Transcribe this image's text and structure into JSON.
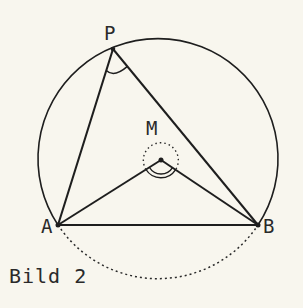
{
  "figure": {
    "caption": "Bild 2",
    "points": {
      "P": {
        "label": "P",
        "x": 113,
        "y": 49
      },
      "M": {
        "label": "M",
        "x": 161,
        "y": 160
      },
      "A": {
        "label": "A",
        "x": 58,
        "y": 225
      },
      "B": {
        "label": "B",
        "x": 258,
        "y": 225
      }
    },
    "circle": {
      "cx": 159,
      "cy": 161,
      "r": 120
    },
    "colors": {
      "background": "#f8f6ee",
      "stroke": "#1e1e1e",
      "text": "#2a2a2a"
    },
    "elements": [
      "circumcircle (solid upper arc, dotted lower arc under chord AB)",
      "triangle APB",
      "center angle AMB with double arc",
      "inscribed angle APB with single arc",
      "dotted reflex angle circle around M"
    ]
  }
}
